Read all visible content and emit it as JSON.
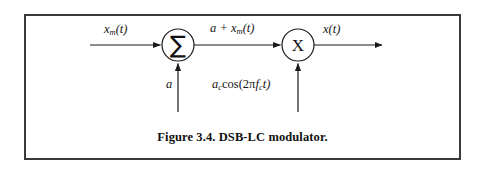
{
  "figure": {
    "caption": "Figure 3.4. DSB-LC modulator.",
    "border_color": "#3a3a3c",
    "background_color": "#ffffff",
    "line_color": "#1a1a1a"
  },
  "diagram": {
    "type": "block-diagram",
    "blocks": [
      {
        "id": "summer",
        "glyph": "∑",
        "name": "summing-junction",
        "cx": 178,
        "cy": 45,
        "r": 16
      },
      {
        "id": "multiplier",
        "glyph": "X",
        "name": "multiplier-junction",
        "cx": 298,
        "cy": 45,
        "r": 16
      }
    ],
    "signals": {
      "message_input": "x_m(t)",
      "dc_offset": "a",
      "summer_output": "a + x_m(t)",
      "carrier": "a_c cos(2πf_c t)",
      "modulated_output": "x(t)"
    },
    "labels": {
      "message_input": {
        "base": "x",
        "sub": "m",
        "tail": "(t)"
      },
      "dc_offset": {
        "base": "a"
      },
      "summer_output": {
        "prefix": "a + ",
        "base": "x",
        "sub": "m",
        "tail": "(t)"
      },
      "carrier": {
        "base": "a",
        "sub": "c",
        "fn": "cos",
        "arg_open": "(2π",
        "arg_base": "f",
        "arg_sub": "c",
        "arg_tail": "t)"
      },
      "modulated_output": {
        "base": "x",
        "tail": "(t)"
      }
    }
  }
}
